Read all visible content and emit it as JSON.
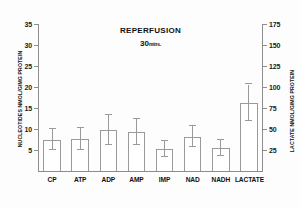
{
  "chart_data": {
    "type": "bar",
    "title": "REPERFUSION",
    "subtitle_value": "30",
    "subtitle_unit": "mins.",
    "categories": [
      "CP",
      "ATP",
      "ADP",
      "AMP",
      "IMP",
      "NAD",
      "NADH",
      "LACTATE"
    ],
    "values": [
      7.5,
      7.7,
      9.7,
      9.2,
      5.2,
      8.2,
      5.5,
      16.3
    ],
    "errors_up": [
      2.4,
      2.6,
      3.6,
      3.1,
      1.9,
      2.6,
      1.9,
      4.3
    ],
    "errors_down": [
      2.4,
      2.6,
      3.6,
      3.1,
      1.9,
      2.6,
      1.9,
      4.3
    ],
    "secondary_axis_values": [
      null,
      null,
      null,
      null,
      null,
      null,
      null,
      81.5
    ],
    "left_axis": {
      "label": "NUCLEOTIDES  NMOL/G/MG PROTEIN",
      "ticks": [
        5,
        10,
        15,
        20,
        25,
        30,
        35
      ],
      "ylim": [
        0,
        35
      ]
    },
    "right_axis": {
      "label": "LACTATE  NMOL/G/MG PROTEIN",
      "ticks": [
        25,
        50,
        75,
        100,
        125,
        150,
        175
      ],
      "ylim": [
        0,
        175
      ]
    },
    "xlabel": "",
    "grid": false,
    "legend": null,
    "colors": {
      "bar_fill": "#ffffff",
      "bar_stroke": "#9a9a9a",
      "axis": "#8d8d8d",
      "text": "#111111",
      "background": "#fdfdfd"
    }
  }
}
